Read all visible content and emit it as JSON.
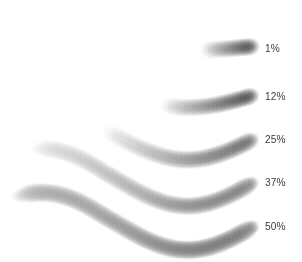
{
  "figure": {
    "background_color": "#ffffff",
    "width": 302,
    "height": 262
  },
  "chart_data": {
    "type": "line",
    "xlabel": "",
    "ylabel": "",
    "categories": [
      "1%",
      "12%",
      "25%",
      "37%",
      "50%"
    ],
    "values": [
      1,
      12,
      25,
      37,
      50
    ],
    "series": [
      {
        "name": "1%",
        "label": "1%",
        "flow_percent": 1,
        "stroke_start_x": 206,
        "stroke_end_x": 253,
        "stroke_y": 46,
        "stroke_width": 19,
        "start_color": "#e8e8e8",
        "end_color": "#2e2e2e",
        "scallop": 0
      },
      {
        "name": "12%",
        "label": "12%",
        "flow_percent": 12,
        "stroke_start_x": 166,
        "stroke_end_x": 253,
        "stroke_y": 94,
        "stroke_width": 19,
        "start_color": "#ededed",
        "end_color": "#303030",
        "scallop": 0
      },
      {
        "name": "25%",
        "label": "25%",
        "flow_percent": 25,
        "stroke_start_x": 106,
        "stroke_end_x": 253,
        "stroke_y": 137,
        "stroke_width": 20,
        "start_color": "#f0f0f0",
        "end_color": "#2b2b2b",
        "scallop": 0.3
      },
      {
        "name": "37%",
        "label": "37%",
        "flow_percent": 37,
        "stroke_start_x": 34,
        "stroke_end_x": 253,
        "stroke_y": 180,
        "stroke_width": 20,
        "start_color": "#e4e4e4",
        "end_color": "#303030",
        "scallop": 0.6
      },
      {
        "name": "50%",
        "label": "50%",
        "flow_percent": 50,
        "stroke_start_x": 16,
        "stroke_end_x": 253,
        "stroke_y": 224,
        "stroke_width": 21,
        "start_color": "#9a9a9a",
        "end_color": "#2a2a2a",
        "scallop": 1
      }
    ],
    "legend_position": "right",
    "grid": false,
    "label_color": "#3a3a3a"
  },
  "labels": [
    {
      "text": "1%",
      "x": 265,
      "y": 42
    },
    {
      "text": "12%",
      "x": 265,
      "y": 90
    },
    {
      "text": "25%",
      "x": 265,
      "y": 133
    },
    {
      "text": "37%",
      "x": 265,
      "y": 176
    },
    {
      "text": "50%",
      "x": 265,
      "y": 220
    }
  ]
}
